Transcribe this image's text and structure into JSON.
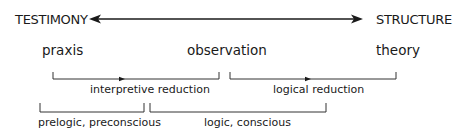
{
  "diagram": {
    "axis": {
      "left_label": "TESTIMONY",
      "right_label": "STRUCTURE",
      "direction": "bidirectional"
    },
    "terms": [
      {
        "label": "praxis"
      },
      {
        "label": "observation"
      },
      {
        "label": "theory"
      }
    ],
    "reductions": [
      {
        "label": "interpretive reduction",
        "from": "praxis",
        "to": "observation"
      },
      {
        "label": "logical reduction",
        "from": "observation",
        "to": "theory"
      }
    ],
    "modes": [
      {
        "label": "prelogic, preconscious"
      },
      {
        "label": "logic, conscious"
      }
    ],
    "colors": {
      "ink": "#1a1a1a",
      "background": "#ffffff"
    }
  }
}
